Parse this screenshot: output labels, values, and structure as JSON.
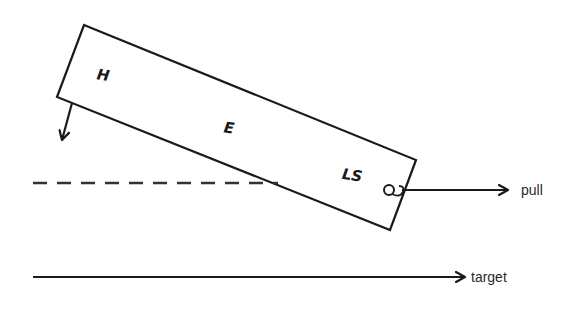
{
  "diagram": {
    "type": "free-body / force diagram",
    "colors": {
      "stroke": "#1a1a1a",
      "background": "#ffffff"
    },
    "rectangle": {
      "corners": [
        [
          84,
          25
        ],
        [
          416,
          160
        ],
        [
          390,
          230
        ],
        [
          57,
          97
        ]
      ],
      "labels": [
        {
          "id": "H",
          "text": "H",
          "x": 97,
          "y": 80
        },
        {
          "id": "E",
          "text": "E",
          "x": 224,
          "y": 133
        },
        {
          "id": "LS",
          "text": "LS",
          "x": 342,
          "y": 180
        }
      ]
    },
    "attachment_loop": {
      "cx": 389,
      "cy": 190,
      "r": 5
    },
    "down_arrow": {
      "from": [
        72,
        103
      ],
      "to": [
        62,
        140
      ]
    },
    "dashed_line": {
      "from": [
        33,
        183
      ],
      "to": [
        278,
        183
      ],
      "dash": "14,10"
    },
    "pull_arrow": {
      "from": [
        402,
        190
      ],
      "to": [
        508,
        190
      ],
      "label": "pull",
      "label_x": 521,
      "label_y": 195
    },
    "target_arrow": {
      "from": [
        33,
        277
      ],
      "to": [
        465,
        277
      ],
      "label": "target",
      "label_x": 471,
      "label_y": 282
    }
  }
}
